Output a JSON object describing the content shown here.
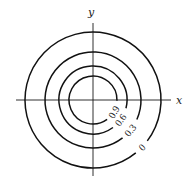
{
  "diagram": {
    "axes": {
      "x_label": "x",
      "y_label": "y",
      "origin_px": [
        93,
        100
      ]
    },
    "contours": [
      {
        "level": "0",
        "radius_px": 68,
        "label_angle_deg": 44,
        "gap_start_deg": 37,
        "gap_end_deg": 51
      },
      {
        "level": "0.3",
        "radius_px": 48,
        "label_angle_deg": 39,
        "gap_start_deg": 24,
        "gap_end_deg": 52
      },
      {
        "level": "0.6",
        "radius_px": 34,
        "label_angle_deg": 36,
        "gap_start_deg": 14,
        "gap_end_deg": 54
      },
      {
        "level": "0.9",
        "radius_px": 24,
        "label_angle_deg": 30,
        "gap_start_deg": 2,
        "gap_end_deg": 54
      }
    ],
    "colors": {
      "line": "#111111",
      "background": "#ffffff"
    }
  }
}
